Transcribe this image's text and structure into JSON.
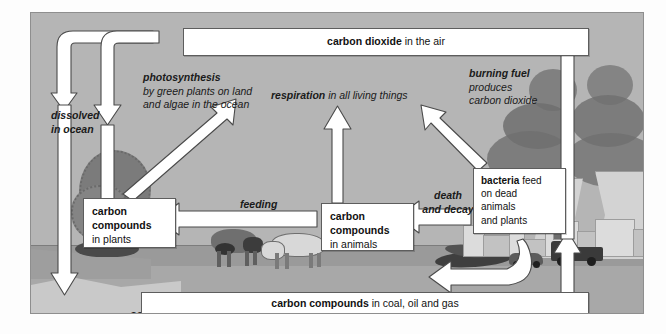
{
  "diagram": {
    "colors": {
      "panel_background": "#b5b5b5",
      "ground": "#9a9a9a",
      "box_fill": "#ffffff",
      "box_border": "#5d5d5d",
      "arrow_fill": "#ffffff",
      "arrow_stroke": "#4a4a4a",
      "smoke": "#6f6f6f",
      "tree": "#7b7b7b"
    },
    "boxes": [
      {
        "id": "co2-air",
        "bold": "carbon dioxide",
        "rest": " in the air"
      },
      {
        "id": "fossil",
        "bold": "carbon compounds",
        "rest": " in coal, oil and gas"
      },
      {
        "id": "plants",
        "bold": "carbon compounds",
        "rest": "in plants"
      },
      {
        "id": "animals",
        "bold": "carbon compounds",
        "rest": "in animals"
      },
      {
        "id": "bacteria",
        "bold": "bacteria",
        "rest": " feed on dead animals and plants"
      }
    ],
    "captions": [
      {
        "id": "photosynthesis",
        "bold": "photosynthesis",
        "rest": "by green plants on land and algae in the ocean"
      },
      {
        "id": "respiration",
        "bold": "respiration",
        "rest": " in all living things"
      },
      {
        "id": "burning-fuel",
        "bold": "burning fuel",
        "rest": "produces carbon dioxide"
      },
      {
        "id": "dissolved",
        "bold": "dissolved in ocean",
        "rest": ""
      },
      {
        "id": "feeding",
        "bold": "feeding",
        "rest": ""
      },
      {
        "id": "death-decay",
        "bold": "death and decay",
        "rest": ""
      },
      {
        "id": "ocean",
        "bold": "ocean",
        "rest": ""
      }
    ],
    "box_co2_bold": "carbon dioxide",
    "box_co2_rest": " in the air",
    "box_fossil_bold": "carbon compounds",
    "box_fossil_rest": " in coal, oil and gas",
    "box_plants_bold_1": "carbon",
    "box_plants_bold_2": "compounds",
    "box_plants_rest": "in plants",
    "box_animals_bold_1": "carbon",
    "box_animals_bold_2": "compounds",
    "box_animals_rest": "in animals",
    "box_bacteria_bold": "bacteria",
    "box_bacteria_rest_1": " feed",
    "box_bacteria_rest_2": "on dead",
    "box_bacteria_rest_3": "animals",
    "box_bacteria_rest_4": "and plants",
    "cap_photo_bold": "photosynthesis",
    "cap_photo_rest": "by green plants on land and algae in the ocean",
    "cap_resp_bold": "respiration",
    "cap_resp_rest": " in all living things",
    "cap_burn_bold": "burning fuel",
    "cap_burn_rest_1": "produces",
    "cap_burn_rest_2": "carbon dioxide",
    "cap_dissolved_1": "dissolved",
    "cap_dissolved_2": "in ocean",
    "cap_feeding": "feeding",
    "cap_death_1": "death",
    "cap_death_2": "and decay",
    "cap_ocean": "ocean",
    "scenery": [
      "tree",
      "two-grazing-cows",
      "dead-organic-matter",
      "cooling-towers",
      "smoke-plumes",
      "factory-buildings",
      "trucks",
      "ocean-shoreline"
    ],
    "arrow_flows": [
      "co2-air -> ocean (dissolved in ocean)",
      "co2-air -> carbon compounds in plants (photosynthesis)",
      "carbon compounds in plants -> co2-air (respiration)",
      "carbon compounds in animals -> co2-air (respiration)",
      "bacteria -> co2-air (respiration)",
      "carbon compounds in plants -> carbon compounds in animals (feeding)",
      "carbon compounds in animals -> bacteria (death and decay)",
      "bacteria -> carbon compounds in coal, oil and gas",
      "carbon compounds in coal, oil and gas -> co2-air (burning fuel)"
    ]
  }
}
